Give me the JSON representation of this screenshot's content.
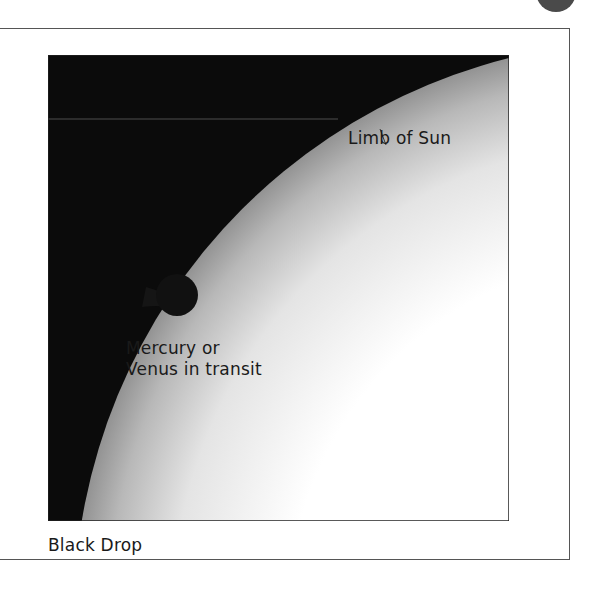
{
  "figure": {
    "title": "Black Drop",
    "labels": {
      "limb": "Limb of Sun",
      "planet_line1": "Mercury or",
      "planet_line2": "Venus in transit",
      "caption": "Black Drop"
    },
    "colors": {
      "sky": "#0a0a0a",
      "sun_edge": "#8a8a8a",
      "sun_center": "#ffffff",
      "planet": "#111111",
      "frame": "#555555"
    }
  }
}
